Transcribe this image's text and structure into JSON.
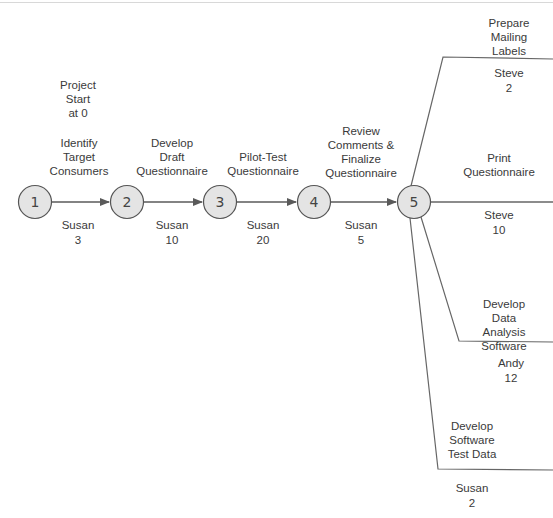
{
  "diagram": {
    "type": "activity-on-arrow network",
    "project_start": "Project\nStart\nat 0",
    "nodes": [
      {
        "id": "1",
        "label": "1"
      },
      {
        "id": "2",
        "label": "2"
      },
      {
        "id": "3",
        "label": "3"
      },
      {
        "id": "4",
        "label": "4"
      },
      {
        "id": "5",
        "label": "5"
      }
    ],
    "activities": [
      {
        "name": "Identify\nTarget\nConsumers",
        "from": "1",
        "to": "2",
        "owner": "Susan",
        "duration": "3"
      },
      {
        "name": "Develop\nDraft\nQuestionnaire",
        "from": "2",
        "to": "3",
        "owner": "Susan",
        "duration": "10"
      },
      {
        "name": "Pilot-Test\nQuestionnaire",
        "from": "3",
        "to": "4",
        "owner": "Susan",
        "duration": "20"
      },
      {
        "name": "Review\nComments &\nFinalize\nQuestionnaire",
        "from": "4",
        "to": "5",
        "owner": "Susan",
        "duration": "5"
      },
      {
        "name": "Prepare\nMailing Labels",
        "from": "5",
        "to": "",
        "owner": "Steve",
        "duration": "2"
      },
      {
        "name": "Print\nQuestionnaire",
        "from": "5",
        "to": "",
        "owner": "Steve",
        "duration": "10"
      },
      {
        "name": "Develop Data\nAnalysis Software",
        "from": "5",
        "to": "",
        "owner": "Andy",
        "duration": "12"
      },
      {
        "name": "Develop\nSoftware\nTest Data",
        "from": "5",
        "to": "",
        "owner": "Susan",
        "duration": "2"
      }
    ],
    "colors": {
      "node_fill": "#e4e4e4",
      "node_stroke": "#555555",
      "line": "#5a5a5a",
      "text": "#3a3a3a"
    }
  }
}
